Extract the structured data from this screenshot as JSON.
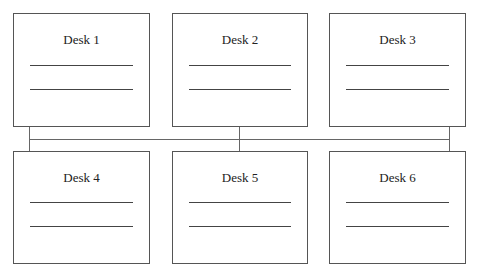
{
  "diagram": {
    "type": "network-bus-topology",
    "desks": [
      {
        "label": "Desk 1",
        "row": 1,
        "col": 1
      },
      {
        "label": "Desk 2",
        "row": 1,
        "col": 2
      },
      {
        "label": "Desk 3",
        "row": 1,
        "col": 3
      },
      {
        "label": "Desk 4",
        "row": 2,
        "col": 1
      },
      {
        "label": "Desk 5",
        "row": 2,
        "col": 2
      },
      {
        "label": "Desk 6",
        "row": 2,
        "col": 3
      }
    ],
    "colors": {
      "stroke": "#555555",
      "background": "#ffffff",
      "text": "#222222"
    }
  }
}
